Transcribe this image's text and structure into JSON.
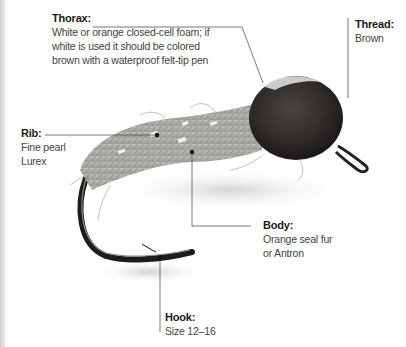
{
  "diagram": {
    "callouts": [
      {
        "id": "thorax",
        "title": "Thorax:",
        "description": "White or orange closed-cell foam; if\nwhite is used it should be colored\nbrown with a waterproof felt-tip pen"
      },
      {
        "id": "thread",
        "title": "Thread:",
        "description": "Brown"
      },
      {
        "id": "rib",
        "title": "Rib:",
        "description": "Fine pearl\nLurex"
      },
      {
        "id": "body",
        "title": "Body:",
        "description": "Orange seal fur\nor Antron"
      },
      {
        "id": "hook",
        "title": "Hook:",
        "description": "Size 12–16"
      }
    ],
    "colors": {
      "background": "#ffffff",
      "text": "#3a3a3a",
      "leader_line": "#555555",
      "thorax_foam": "#2e2b28",
      "body_dubbing": "#a9a9a3",
      "hook_metal": "#1c1c1c"
    }
  }
}
